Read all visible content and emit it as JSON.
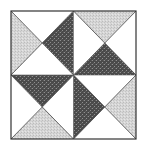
{
  "diagram": {
    "square": {
      "x": 11,
      "y": 11,
      "width": 125,
      "height": 128
    },
    "colors": {
      "background": "#ffffff",
      "light": "#d6d6d6",
      "light_speckle": "#b8b8b8",
      "dark": "#4a4a4a",
      "dark_speckle": "#9a9a9a",
      "white": "#ffffff",
      "stroke": "#333333"
    },
    "quadrants": [
      {
        "name": "top-left",
        "top": "white",
        "right": "dark",
        "bottom": "white",
        "left": "light"
      },
      {
        "name": "top-right",
        "top": "light",
        "right": "white",
        "bottom": "dark",
        "left": "white"
      },
      {
        "name": "bottom-left",
        "top": "dark",
        "right": "white",
        "bottom": "light",
        "left": "white"
      },
      {
        "name": "bottom-right",
        "top": "white",
        "right": "light",
        "bottom": "white",
        "left": "dark"
      }
    ]
  }
}
